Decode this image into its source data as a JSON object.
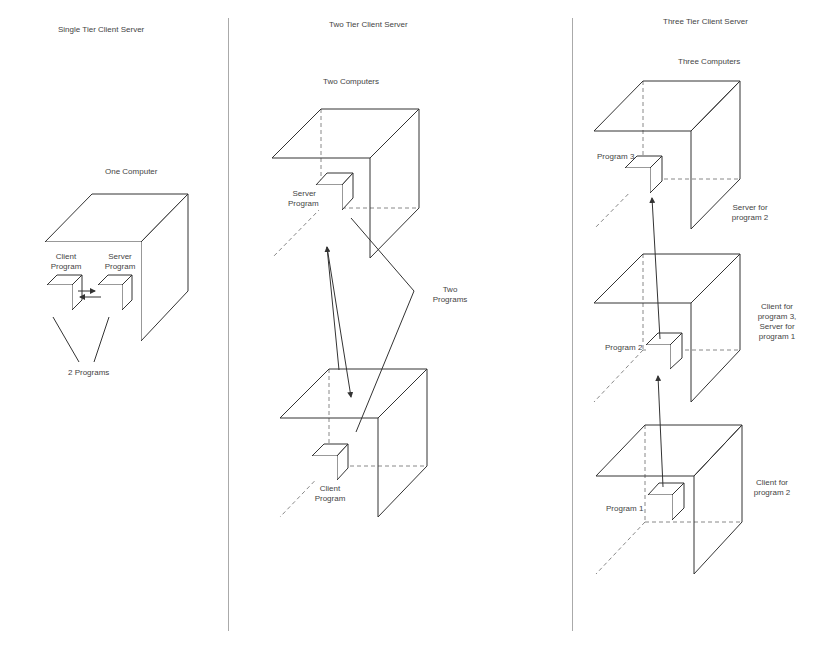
{
  "panels": [
    {
      "title": "Single Tier Client Server",
      "subtitle": "One Computer",
      "labels": {
        "client": "Client\nProgram",
        "client_line1": "Client",
        "client_line2": "Program",
        "server_line1": "Server",
        "server_line2": "Program",
        "programs": "2 Programs"
      }
    },
    {
      "title": "Two Tier Client Server",
      "subtitle": "Two Computers",
      "labels": {
        "server_line1": "Server",
        "server_line2": "Program",
        "client_line1": "Client",
        "client_line2": "Program",
        "programs_line1": "Two",
        "programs_line2": "Programs"
      }
    },
    {
      "title": "Three Tier Client Server",
      "subtitle": "Three Computers",
      "labels": {
        "program3": "Program 3",
        "program2": "Program 2",
        "program1": "Program 1",
        "role_top_line1": "Server for",
        "role_top_line2": "program 2",
        "role_mid_line1": "Client for",
        "role_mid_line2": "program 3,",
        "role_mid_line3": "Server for",
        "role_mid_line4": "program 1",
        "role_bottom_line1": "Client for",
        "role_bottom_line2": "program 2"
      }
    }
  ]
}
